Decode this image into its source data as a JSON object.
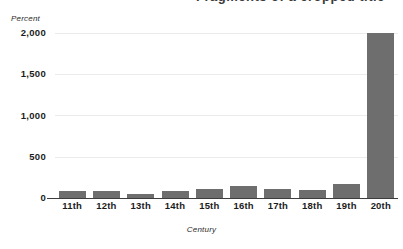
{
  "title_fragment": "Fragments of a cropped title",
  "chart_data": {
    "type": "bar",
    "title": "",
    "xlabel": "Century",
    "ylabel": "Percent",
    "categories": [
      "11th",
      "12th",
      "13th",
      "14th",
      "15th",
      "16th",
      "17th",
      "18th",
      "19th",
      "20th"
    ],
    "values": [
      85,
      85,
      45,
      80,
      110,
      140,
      105,
      95,
      175,
      2000
    ],
    "ylim": [
      0,
      2000
    ],
    "yticks": [
      0,
      500,
      1000,
      1500,
      2000
    ],
    "ytick_labels": [
      "0",
      "500",
      "1,000",
      "1,500",
      "2,000"
    ],
    "grid": true,
    "legend": "none",
    "series_color": "#6e6e6e",
    "gridline_color": "#ebebeb",
    "axis_color": "#3d3d3d"
  }
}
